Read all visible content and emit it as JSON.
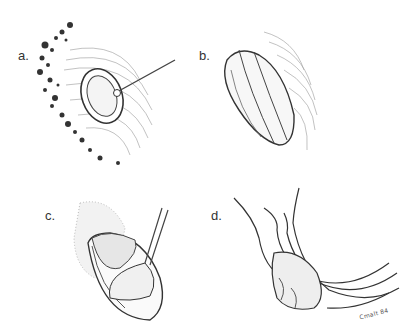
{
  "figure": {
    "panels": [
      {
        "id": "a",
        "label": "a.",
        "description": "oval ring instrument placed on tissue with handle"
      },
      {
        "id": "b",
        "label": "b.",
        "description": "elongated oval segmented structure with hatched surroundings"
      },
      {
        "id": "c",
        "label": "c.",
        "description": "spatula retracting tissue within oval cavity"
      },
      {
        "id": "d",
        "label": "d.",
        "description": "curved tubular structures with lobulated mass"
      }
    ],
    "signature": "Cmalt 84"
  }
}
